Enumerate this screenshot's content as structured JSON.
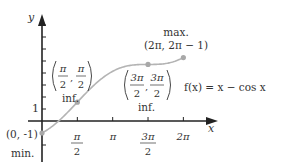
{
  "chart_data": {
    "type": "line",
    "title": "",
    "function_label": "f(x) = x − cos x",
    "xlabel": "x",
    "ylabel": "y",
    "xlim": [
      0,
      6.2832
    ],
    "ylim": [
      -1,
      5.2832
    ],
    "grid": false,
    "x_ticks": [
      {
        "value": 1.5708,
        "num": "π",
        "den": "2"
      },
      {
        "value": 3.1416,
        "num": "π",
        "den": ""
      },
      {
        "value": 4.7124,
        "num": "3π",
        "den": "2"
      },
      {
        "value": 6.2832,
        "num": "2π",
        "den": ""
      }
    ],
    "y_ticks": [
      1,
      2,
      3,
      4,
      5,
      6,
      7,
      8
    ],
    "y_tick_label": "1",
    "series": [
      {
        "name": "f(x) = x − cos x",
        "color": "#b0b0b0"
      }
    ],
    "points": [
      {
        "x": 0,
        "y": -1,
        "coord": "(0, -1)",
        "note": "min."
      },
      {
        "x": 1.5708,
        "y": 1.5708,
        "coord_num": [
          "π",
          "π"
        ],
        "coord_den": [
          "2",
          "2"
        ],
        "note": "inf."
      },
      {
        "x": 4.7124,
        "y": 4.7124,
        "coord_num": [
          "3π",
          "3π"
        ],
        "coord_den": [
          "2",
          "2"
        ],
        "note": "inf."
      },
      {
        "x": 6.2832,
        "y": 5.2832,
        "coord": "(2π, 2π − 1)",
        "note": "max."
      }
    ]
  },
  "colors": {
    "axis": "#222222",
    "curve": "#b4b4b4",
    "point": "#a8a8a8",
    "text": "#333333"
  }
}
